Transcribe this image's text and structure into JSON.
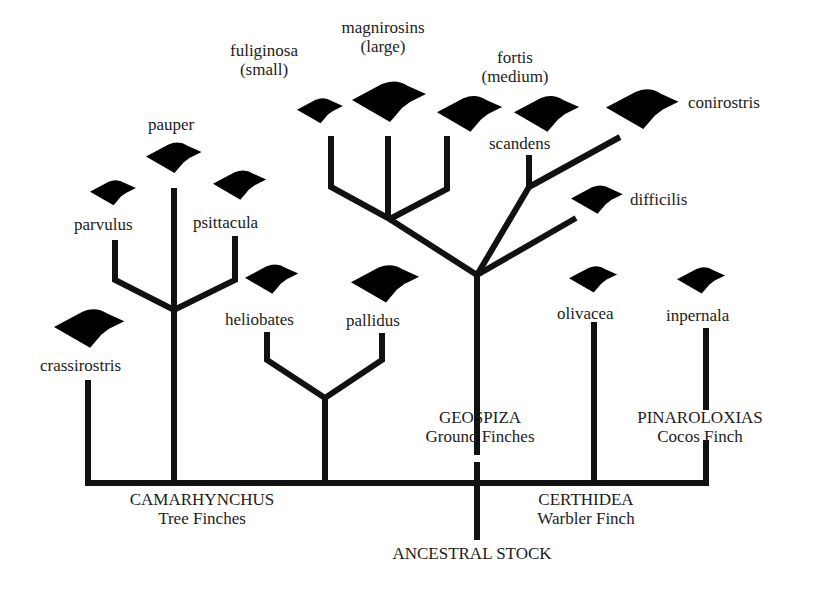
{
  "diagram": {
    "type": "phylogenetic-tree",
    "root": "ANCESTRAL STOCK",
    "groups": [
      {
        "genus": "CAMARHYNCHUS",
        "common": "Tree Finches",
        "species": [
          "crassirostris",
          "parvulus",
          "pauper",
          "psittacula",
          "heliobates",
          "pallidus"
        ]
      },
      {
        "genus": "GEOSPIZA",
        "common": "Ground Finches",
        "species": [
          "fuliginosa (small)",
          "magnirosins (large)",
          "fortis (medium)",
          "scandens",
          "conirostris",
          "difficilis"
        ]
      },
      {
        "genus": "CERTHIDEA",
        "common": "Warbler Finch",
        "species": [
          "olivacea"
        ]
      },
      {
        "genus": "PINAROLOXIAS",
        "common": "Cocos Finch",
        "species": [
          "inpernala"
        ]
      }
    ]
  },
  "labels": {
    "fuliginosa": "fuliginosa",
    "fuliginosa_note": "(small)",
    "magnirosins": "magnirosins",
    "magnirosins_note": "(large)",
    "fortis": "fortis",
    "fortis_note": "(medium)",
    "conirostris": "conirostris",
    "scandens": "scandens",
    "difficilis": "difficilis",
    "pauper": "pauper",
    "parvulus": "parvulus",
    "psittacula": "psittacula",
    "heliobates": "heliobates",
    "pallidus": "pallidus",
    "crassirostris": "crassirostris",
    "olivacea": "olivacea",
    "inpernala": "inpernala",
    "geospiza": "GEOSPIZA",
    "geospiza_common": "Ground Finches",
    "pinaroloxias": "PINAROLOXIAS",
    "pinaroloxias_common": "Cocos Finch",
    "camarhynchus": "CAMARHYNCHUS",
    "camarhynchus_common": "Tree Finches",
    "certhidea": "CERTHIDEA",
    "certhidea_common": "Warbler Finch",
    "ancestral": "ANCESTRAL STOCK"
  },
  "colors": {
    "line": "#111111",
    "background": "#ffffff"
  }
}
